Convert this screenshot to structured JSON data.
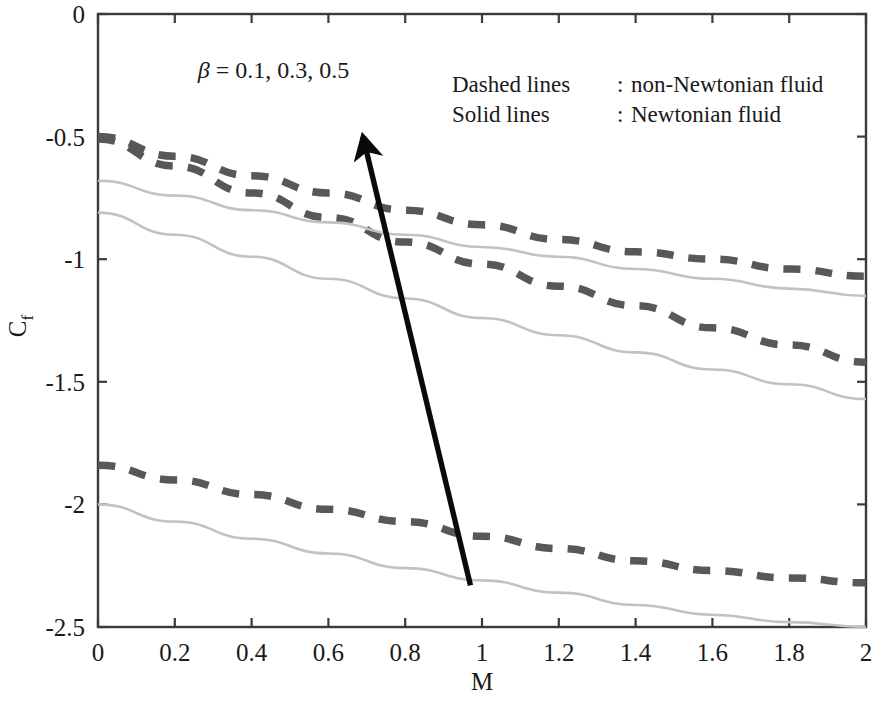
{
  "chart_data": {
    "type": "line",
    "title": "",
    "xlabel": "M",
    "ylabel": "C_f",
    "xlim": [
      0,
      2
    ],
    "ylim": [
      -2.5,
      0
    ],
    "grid": false,
    "xticks": [
      "0",
      "0.2",
      "0.4",
      "0.6",
      "0.8",
      "1",
      "1.2",
      "1.4",
      "1.6",
      "1.8",
      "2"
    ],
    "xtick_values": [
      0,
      0.2,
      0.4,
      0.6,
      0.8,
      1,
      1.2,
      1.4,
      1.6,
      1.8,
      2
    ],
    "yticks": [
      "0",
      "-0.5",
      "-1",
      "-1.5",
      "-2",
      "-2.5"
    ],
    "ytick_values": [
      0,
      -0.5,
      -1,
      -1.5,
      -2,
      -2.5
    ],
    "x": [
      0,
      0.2,
      0.4,
      0.6,
      0.8,
      1.0,
      1.2,
      1.4,
      1.6,
      1.8,
      2.0
    ],
    "series": [
      {
        "name": "non-Newtonian, beta = 0.5",
        "style": "dashed",
        "color": "#585858",
        "values": [
          -0.5,
          -0.58,
          -0.66,
          -0.73,
          -0.8,
          -0.86,
          -0.92,
          -0.97,
          -1.0,
          -1.04,
          -1.07
        ]
      },
      {
        "name": "non-Newtonian, beta = 0.3",
        "style": "dashed",
        "color": "#585858",
        "values": [
          -0.51,
          -0.62,
          -0.73,
          -0.83,
          -0.93,
          -1.02,
          -1.11,
          -1.19,
          -1.28,
          -1.35,
          -1.42
        ]
      },
      {
        "name": "non-Newtonian, beta = 0.1",
        "style": "dashed",
        "color": "#585858",
        "values": [
          -1.84,
          -1.9,
          -1.96,
          -2.02,
          -2.07,
          -2.13,
          -2.18,
          -2.23,
          -2.27,
          -2.3,
          -2.32
        ]
      },
      {
        "name": "Newtonian, beta = 0.5",
        "style": "solid",
        "color": "#c2c2c2",
        "values": [
          -0.68,
          -0.74,
          -0.8,
          -0.85,
          -0.9,
          -0.95,
          -0.99,
          -1.04,
          -1.08,
          -1.12,
          -1.15
        ]
      },
      {
        "name": "Newtonian, beta = 0.3",
        "style": "solid",
        "color": "#c2c2c2",
        "values": [
          -0.81,
          -0.9,
          -0.99,
          -1.08,
          -1.16,
          -1.24,
          -1.31,
          -1.38,
          -1.45,
          -1.51,
          -1.57
        ]
      },
      {
        "name": "Newtonian, beta = 0.1",
        "style": "solid",
        "color": "#c2c2c2",
        "values": [
          -2.0,
          -2.07,
          -2.14,
          -2.2,
          -2.26,
          -2.31,
          -2.36,
          -2.41,
          -2.45,
          -2.48,
          -2.5
        ]
      }
    ],
    "annotations": [
      {
        "name": "beta-annotation",
        "symbol": "β",
        "text": " = 0.1, 0.3, 0.5",
        "x": 0.26,
        "y": -0.26
      },
      {
        "name": "increase-arrow",
        "kind": "arrow",
        "from_x": 0.97,
        "from_y": -2.33,
        "to_x": 0.69,
        "to_y": -0.5
      }
    ],
    "legend": {
      "position": "top-right-inside",
      "entries": [
        {
          "label": "Dashed lines",
          "separator": ":",
          "value": "non-Newtonian fluid"
        },
        {
          "label": "Solid lines",
          "separator": ":",
          "value": "Newtonian fluid"
        }
      ]
    }
  },
  "axes": {
    "x_title": "M",
    "y_title": "C",
    "y_title_sub": "f"
  },
  "colors": {
    "dashed_line": "#585858",
    "solid_line": "#c2c2c2",
    "axis": "#3a3a3a",
    "arrow": "#0a0a0a",
    "text": "#1a1a1a",
    "background": "#ffffff"
  }
}
